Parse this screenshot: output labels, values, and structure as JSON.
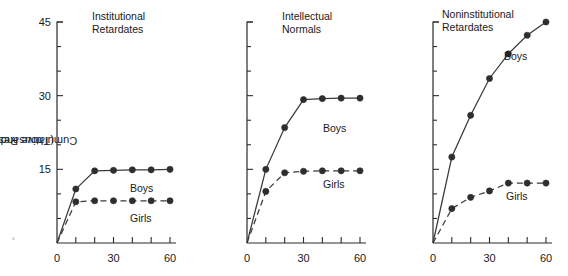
{
  "axis": {
    "y_title_line1": "Cumulative Response",
    "y_title_line2": "(Thousands)",
    "y_ticks_major": [
      0,
      15,
      30,
      45
    ],
    "y_tick_labels": [
      "",
      "15",
      "30",
      "45"
    ],
    "y_ticks_minor": [
      5,
      10,
      20,
      25,
      35,
      40
    ],
    "ylim": [
      0,
      45
    ],
    "x_ticks": [
      0,
      10,
      20,
      30,
      40,
      50,
      60
    ],
    "x_tick_labels": [
      "0",
      "",
      "",
      "30",
      "",
      "",
      "60"
    ],
    "xlim": [
      0,
      60
    ],
    "label_0": "0",
    "label_15": "15",
    "label_30": "30",
    "label_45": "45",
    "label_x0": "0",
    "label_x30": "30",
    "label_x60": "60"
  },
  "series_labels": {
    "boys": "Boys",
    "girls": "Girls"
  },
  "colors": {
    "line": "#3a3a3a",
    "marker": "#2e2e2e",
    "axis": "#2b2b2b",
    "text": "#1a1a1a"
  },
  "panels": [
    {
      "title_line1": "Institutional",
      "title_line2": "Retardates",
      "boys_label": "Boys",
      "girls_label": "Girls"
    },
    {
      "title_line1": "Intellectual",
      "title_line2": "Normals",
      "boys_label": "Boys",
      "girls_label": "Girls"
    },
    {
      "title_line1": "Noninstitutional",
      "title_line2": "Retardates",
      "boys_label": "Boys",
      "girls_label": "Girls"
    }
  ],
  "chart_data": {
    "type": "line",
    "title": "",
    "xlabel": "",
    "ylabel": "Cumulative Response (Thousands)",
    "xlim": [
      0,
      60
    ],
    "ylim": [
      0,
      45
    ],
    "grid": false,
    "legend": "inline-annotations",
    "x": [
      0,
      10,
      20,
      30,
      40,
      50,
      60
    ],
    "panels": [
      {
        "name": "Institutional Retardates",
        "series": [
          {
            "name": "Boys",
            "style": "solid",
            "values": [
              0,
              11.0,
              14.7,
              14.8,
              14.9,
              14.9,
              15.0
            ]
          },
          {
            "name": "Girls",
            "style": "dashed",
            "values": [
              0,
              8.4,
              8.6,
              8.6,
              8.6,
              8.6,
              8.6
            ]
          }
        ]
      },
      {
        "name": "Intellectual Normals",
        "series": [
          {
            "name": "Boys",
            "style": "solid",
            "values": [
              0,
              15.0,
              23.5,
              29.2,
              29.4,
              29.5,
              29.5
            ]
          },
          {
            "name": "Girls",
            "style": "dashed",
            "values": [
              0,
              10.5,
              14.3,
              14.6,
              14.7,
              14.7,
              14.7
            ]
          }
        ]
      },
      {
        "name": "Noninstitutional Retardates",
        "series": [
          {
            "name": "Boys",
            "style": "solid",
            "values": [
              0,
              17.5,
              26.0,
              33.5,
              38.5,
              42.3,
              45.0
            ]
          },
          {
            "name": "Girls",
            "style": "dashed",
            "values": [
              0,
              7.0,
              9.3,
              10.6,
              12.2,
              12.2,
              12.2
            ]
          }
        ]
      }
    ]
  }
}
